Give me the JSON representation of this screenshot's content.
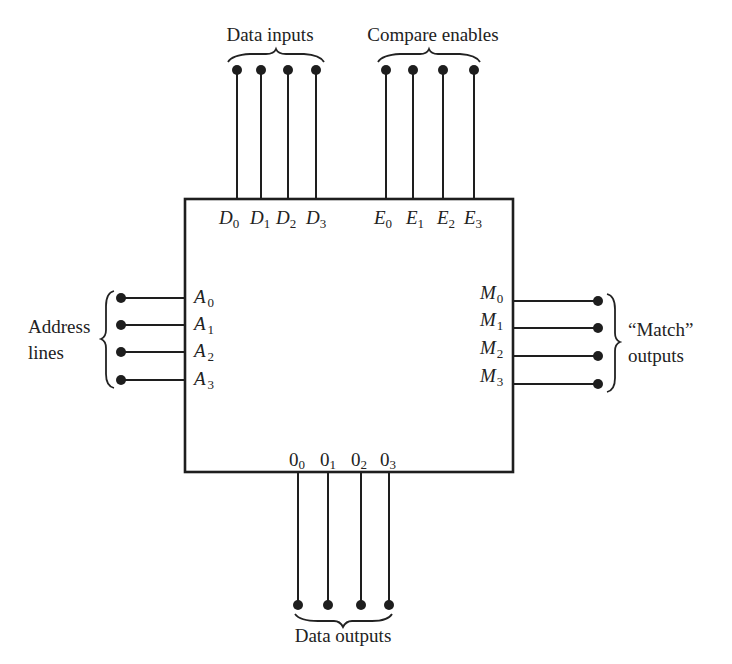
{
  "diagram": {
    "groups": {
      "data_inputs": "Data inputs",
      "compare_enables": "Compare enables",
      "address_lines_1": "Address",
      "address_lines_2": "lines",
      "match_outputs_1": "“Match”",
      "match_outputs_2": "outputs",
      "data_outputs": "Data outputs"
    },
    "pins": {
      "data_inputs": [
        {
          "base": "D",
          "sub": "0"
        },
        {
          "base": "D",
          "sub": "1"
        },
        {
          "base": "D",
          "sub": "2"
        },
        {
          "base": "D",
          "sub": "3"
        }
      ],
      "compare_enables": [
        {
          "base": "E",
          "sub": "0"
        },
        {
          "base": "E",
          "sub": "1"
        },
        {
          "base": "E",
          "sub": "2"
        },
        {
          "base": "E",
          "sub": "3"
        }
      ],
      "address_lines": [
        {
          "base": "A",
          "sub": "0"
        },
        {
          "base": "A",
          "sub": "1"
        },
        {
          "base": "A",
          "sub": "2"
        },
        {
          "base": "A",
          "sub": "3"
        }
      ],
      "match_outputs": [
        {
          "base": "M",
          "sub": "0"
        },
        {
          "base": "M",
          "sub": "1"
        },
        {
          "base": "M",
          "sub": "2"
        },
        {
          "base": "M",
          "sub": "3"
        }
      ],
      "data_outputs": [
        {
          "base": "0",
          "sub": "0"
        },
        {
          "base": "0",
          "sub": "1"
        },
        {
          "base": "0",
          "sub": "2"
        },
        {
          "base": "0",
          "sub": "3"
        }
      ]
    },
    "colors": {
      "ink": "#1e1e1e",
      "background": "#ffffff"
    }
  }
}
